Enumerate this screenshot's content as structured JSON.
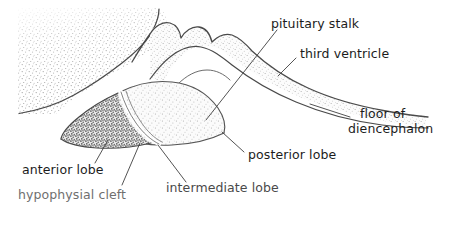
{
  "figure": {
    "kind": "anatomical-line-drawing",
    "background_color": "#ffffff",
    "ink_color": "#3a3a3a",
    "width": 460,
    "height": 231
  },
  "labels": {
    "pituitary_stalk": "pituitary stalk",
    "third_ventricle": "third ventricle",
    "floor_line1": "floor of",
    "floor_line2": "diencephalon",
    "posterior_lobe": "posterior lobe",
    "intermediate_lobe": "intermediate lobe",
    "anterior_lobe": "anterior lobe",
    "hypophysial_cleft": "hypophysial cleft"
  },
  "regions": {
    "brain_mass": "stippled brain tissue, upper left",
    "anterior_lobe_fill": "dark dense stipple",
    "posterior_lobe_fill": "light stipple",
    "cleft": "white curved slit between anterior and posterior lobes",
    "diencephalon_floor": "light stippled band extending to the right"
  }
}
